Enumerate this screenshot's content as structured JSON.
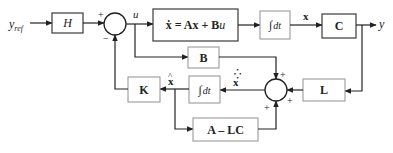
{
  "diagram": {
    "input_label": "y",
    "input_subscript": "ref",
    "output_label": "y",
    "signals": {
      "u": "u",
      "x": "x",
      "x_hat": "x̂",
      "x_hat_dot": "x̂̇"
    },
    "blocks": {
      "H": "H",
      "plant_lhs": "ẋ = Ax + B",
      "plant_rhs_u": "u",
      "integrator_top_symbol": "∫",
      "integrator_top_dt": "dt",
      "C": "C",
      "B": "B",
      "K": "K",
      "integrator_bottom_symbol": "∫",
      "integrator_bottom_dt": "dt",
      "L": "L",
      "A_minus_LC": "A – LC"
    },
    "summing_junctions": {
      "sum1_signs": {
        "left": "+",
        "bottom": "−"
      },
      "sum2_signs": {
        "top": "+",
        "right": "+",
        "bottom": "+"
      }
    }
  }
}
